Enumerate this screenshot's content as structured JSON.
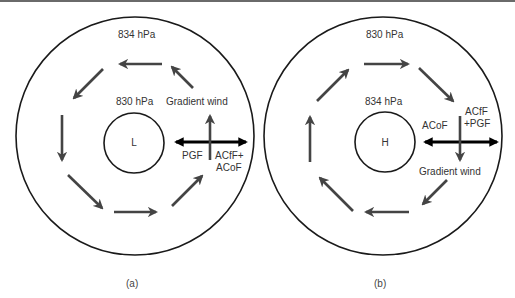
{
  "figure": {
    "panels": [
      {
        "id": "a",
        "caption": "(a)",
        "outer_isobar": "834 hPa",
        "inner_isobar": "830 hPa",
        "center_label": "L",
        "force_labels": {
          "gradient_wind": "Gradient wind",
          "pgf": "PGF",
          "acf_line1": "ACfF+",
          "acf_line2": "ACoF"
        },
        "rotation": "counterclockwise"
      },
      {
        "id": "b",
        "caption": "(b)",
        "outer_isobar": "830 hPa",
        "inner_isobar": "834 hPa",
        "center_label": "H",
        "force_labels": {
          "acof": "ACoF",
          "acf_line1": "ACfF",
          "acf_line2": "+PGF",
          "gradient_wind": "Gradient wind"
        },
        "rotation": "clockwise"
      }
    ],
    "colors": {
      "circle_stroke": "#1a1a1a",
      "flow_arrow": "#444444",
      "force_arrow": "#000000",
      "text": "#333333"
    }
  }
}
